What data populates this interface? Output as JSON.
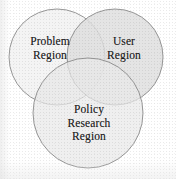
{
  "diagram": {
    "type": "venn-3-circle",
    "background_color": "#ffffff",
    "outline_color": "#8a8a8a",
    "text_color": "#1c1c1c",
    "circles": [
      {
        "id": "problem",
        "name": "problem-region-circle",
        "label_lines": [
          "Problem",
          "Region"
        ],
        "fill_color": "#f2f2f2",
        "cx": 57,
        "cy": 57,
        "r": 48
      },
      {
        "id": "user",
        "name": "user-region-circle",
        "label_lines": [
          "User",
          "Region"
        ],
        "fill_color": "#e3e3e3",
        "cx": 115,
        "cy": 57,
        "r": 48
      },
      {
        "id": "policy",
        "name": "policy-research-region-circle",
        "label_lines": [
          "Policy",
          "Research",
          "Region"
        ],
        "fill_color": "#ededed",
        "cx": 88,
        "cy": 113,
        "r": 55
      }
    ]
  }
}
